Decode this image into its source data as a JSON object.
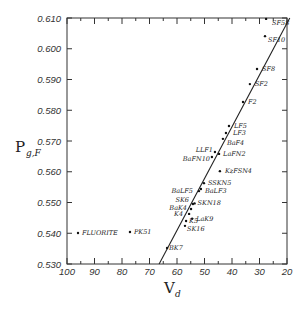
{
  "chart_data": {
    "type": "scatter",
    "title": "",
    "xlabel": "V",
    "xlabel_subscript": "d",
    "ylabel": "P",
    "ylabel_subscript": "g,F",
    "xlim": [
      100,
      20
    ],
    "ylim": [
      0.53,
      0.61
    ],
    "x_reversed": true,
    "grid": false,
    "legend": "none",
    "x_ticks": [
      100,
      90,
      80,
      70,
      60,
      50,
      40,
      30,
      20
    ],
    "x_tick_labels": [
      "100",
      "90",
      "80",
      "70",
      "60",
      "50",
      "40",
      "30",
      "20"
    ],
    "y_ticks": [
      0.53,
      0.54,
      0.55,
      0.56,
      0.57,
      0.58,
      0.59,
      0.6,
      0.61
    ],
    "y_tick_labels": [
      "0.530",
      "0.540",
      "0.550",
      "0.560",
      "0.570",
      "0.580",
      "0.590",
      "0.600",
      "0.610"
    ],
    "normal_line": {
      "x": [
        66.5,
        19.0
      ],
      "y": [
        0.53,
        0.61
      ]
    },
    "points": [
      {
        "label": "SF58",
        "x": 27.6,
        "y": 0.6097,
        "lx": 6,
        "ly": 6,
        "anchor": "start"
      },
      {
        "label": "SF10",
        "x": 28.0,
        "y": 0.6041,
        "lx": 3,
        "ly": 6,
        "anchor": "start"
      },
      {
        "label": "SF8",
        "x": 30.9,
        "y": 0.5934,
        "lx": 5,
        "ly": 2,
        "anchor": "start"
      },
      {
        "label": "SF2",
        "x": 33.5,
        "y": 0.5885,
        "lx": 5,
        "ly": 2,
        "anchor": "start"
      },
      {
        "label": "F2",
        "x": 36.0,
        "y": 0.5827,
        "lx": 5,
        "ly": 2,
        "anchor": "start"
      },
      {
        "label": "LF5",
        "x": 41.1,
        "y": 0.5749,
        "lx": 5,
        "ly": 2,
        "anchor": "start"
      },
      {
        "label": "LF3",
        "x": 42.2,
        "y": 0.5726,
        "lx": 7,
        "ly": 2,
        "anchor": "start"
      },
      {
        "label": "BaF4",
        "x": 43.3,
        "y": 0.5707,
        "lx": 4,
        "ly": 6,
        "anchor": "start"
      },
      {
        "label": "LLF1",
        "x": 46.2,
        "y": 0.5664,
        "lx": -2,
        "ly": 0,
        "anchor": "end"
      },
      {
        "label": "LaFN2",
        "x": 44.7,
        "y": 0.5658,
        "lx": 4,
        "ly": 2,
        "anchor": "start"
      },
      {
        "label": "BaFN10",
        "x": 47.3,
        "y": 0.5648,
        "lx": -2,
        "ly": 4,
        "anchor": "end"
      },
      {
        "label": "KzFSN4",
        "x": 44.4,
        "y": 0.5602,
        "lx": 5,
        "ly": 2,
        "anchor": "start"
      },
      {
        "label": "SSKN5",
        "x": 50.2,
        "y": 0.5563,
        "lx": 4,
        "ly": 2,
        "anchor": "start"
      },
      {
        "label": "BaLF3",
        "x": 51.3,
        "y": 0.5544,
        "lx": 4,
        "ly": 4,
        "anchor": "start"
      },
      {
        "label": "BaLF5",
        "x": 52.0,
        "y": 0.5537,
        "lx": -6,
        "ly": 2,
        "anchor": "end"
      },
      {
        "label": "SKN18",
        "x": 53.6,
        "y": 0.5497,
        "lx": 3,
        "ly": 2,
        "anchor": "start"
      },
      {
        "label": "SK6",
        "x": 54.2,
        "y": 0.5495,
        "lx": -4,
        "ly": -2,
        "anchor": "end"
      },
      {
        "label": "BaK4",
        "x": 54.9,
        "y": 0.5479,
        "lx": -4,
        "ly": 1,
        "anchor": "end"
      },
      {
        "label": "K4",
        "x": 55.6,
        "y": 0.5463,
        "lx": -6,
        "ly": 2,
        "anchor": "end"
      },
      {
        "label": "LaK9",
        "x": 54.5,
        "y": 0.5447,
        "lx": 4,
        "ly": 2,
        "anchor": "start"
      },
      {
        "label": "K5",
        "x": 56.7,
        "y": 0.544,
        "lx": 3,
        "ly": 2,
        "anchor": "start"
      },
      {
        "label": "SK16",
        "x": 57.1,
        "y": 0.5424,
        "lx": 2,
        "ly": 5,
        "anchor": "start"
      },
      {
        "label": "BK7",
        "x": 63.6,
        "y": 0.5352,
        "lx": 2,
        "ly": 2,
        "anchor": "start"
      },
      {
        "label": "FLUORITE",
        "x": 96.0,
        "y": 0.5401,
        "lx": 4,
        "ly": 2,
        "anchor": "start"
      },
      {
        "label": "PK51",
        "x": 77.1,
        "y": 0.5404,
        "lx": 4,
        "ly": 2,
        "anchor": "start"
      }
    ]
  }
}
